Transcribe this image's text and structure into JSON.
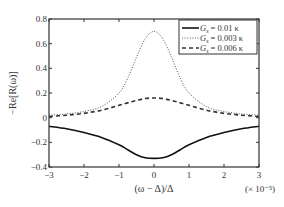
{
  "chart_data": {
    "type": "line",
    "title": "",
    "xlabel": "(ω − Δ)/Δ",
    "x_multiplier": "(× 10⁻⁵)",
    "ylabel": "−Re[R(ω)]",
    "xlim": [
      -3,
      3
    ],
    "ylim": [
      -0.4,
      0.8
    ],
    "xticks": [
      -3,
      -2,
      -1,
      0,
      1,
      2,
      3
    ],
    "yticks": [
      -0.4,
      -0.2,
      0,
      0.2,
      0.4,
      0.6,
      0.8
    ],
    "ytick_labels": [
      "−0.4",
      "−0.2",
      "0",
      "0.2",
      "0.4",
      "0.6",
      "0.8"
    ],
    "xtick_labels": [
      "−3",
      "−2",
      "−1",
      "0",
      "1",
      "2",
      "3"
    ],
    "grid": false,
    "legend_position": "upper right",
    "x": [
      -3,
      -2.5,
      -2,
      -1.5,
      -1,
      -0.75,
      -0.5,
      -0.25,
      0,
      0.25,
      0.5,
      0.75,
      1,
      1.5,
      2,
      2.5,
      3
    ],
    "series": [
      {
        "name": "G_s = 0.01 κ",
        "style": "solid",
        "values": [
          -0.07,
          -0.09,
          -0.12,
          -0.16,
          -0.22,
          -0.26,
          -0.3,
          -0.325,
          -0.33,
          -0.325,
          -0.3,
          -0.26,
          -0.22,
          -0.16,
          -0.12,
          -0.09,
          -0.07
        ]
      },
      {
        "name": "G_s = 0.003 κ",
        "style": "dotted",
        "values": [
          0.02,
          0.03,
          0.05,
          0.09,
          0.2,
          0.32,
          0.49,
          0.64,
          0.7,
          0.64,
          0.49,
          0.32,
          0.2,
          0.09,
          0.05,
          0.03,
          0.02
        ]
      },
      {
        "name": "G_s = 0.006 κ",
        "style": "dashed",
        "values": [
          0.01,
          0.02,
          0.035,
          0.06,
          0.1,
          0.12,
          0.14,
          0.155,
          0.16,
          0.155,
          0.14,
          0.12,
          0.1,
          0.06,
          0.035,
          0.02,
          0.01
        ]
      }
    ],
    "legend": [
      {
        "label_prefix": "G",
        "label_sub": "s",
        "label_suffix": " = 0.01 κ",
        "style": "solid"
      },
      {
        "label_prefix": "G",
        "label_sub": "s",
        "label_suffix": " = 0.003 κ",
        "style": "dotted"
      },
      {
        "label_prefix": "G",
        "label_sub": "s",
        "label_suffix": " = 0.006 κ",
        "style": "dashed"
      }
    ]
  }
}
